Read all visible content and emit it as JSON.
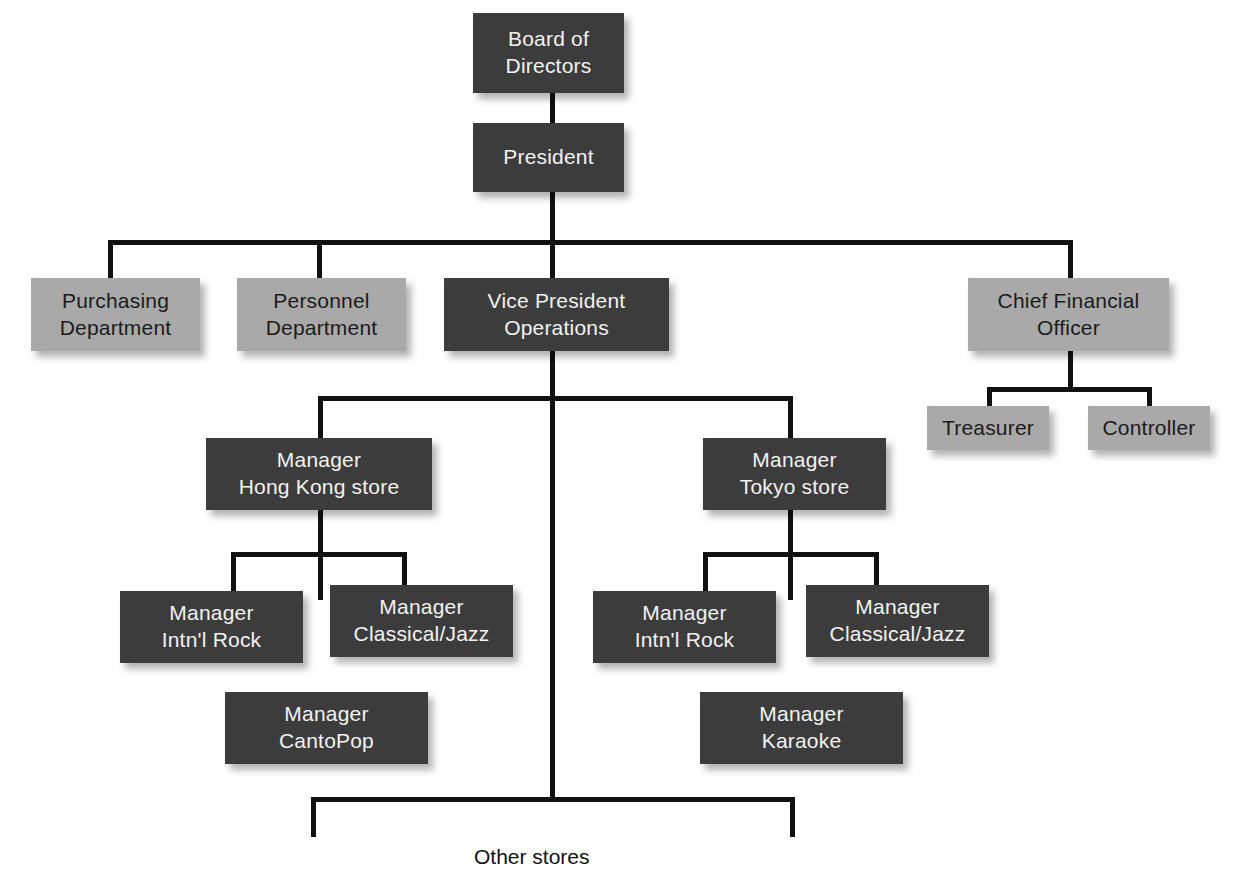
{
  "diagram": {
    "colors": {
      "dark_box": "#3c3c3c",
      "light_box": "#a9a9a9",
      "dark_text": "#f2f2f2",
      "light_text": "#1b1b1b",
      "connector": "#111111",
      "background": "#ffffff"
    },
    "nodes": {
      "board": "Board of\nDirectors",
      "president": "President",
      "purchasing": "Purchasing\nDepartment",
      "personnel": "Personnel\nDepartment",
      "vp_operations": "Vice President\nOperations",
      "cfo": "Chief Financial\nOfficer",
      "treasurer": "Treasurer",
      "controller": "Controller",
      "mgr_hong_kong": "Manager\nHong Kong store",
      "mgr_tokyo": "Manager\nTokyo store",
      "hk_rock": "Manager\nIntn'l Rock",
      "hk_classical": "Manager\nClassical/Jazz",
      "hk_cantopop": "Manager\nCantoPop",
      "tk_rock": "Manager\nIntn'l Rock",
      "tk_classical": "Manager\nClassical/Jazz",
      "tk_karaoke": "Manager\nKaraoke",
      "other_stores": "Other stores"
    }
  }
}
